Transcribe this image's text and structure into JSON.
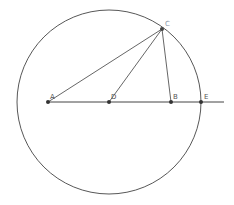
{
  "diagram": {
    "type": "geometry-construction",
    "circle": {
      "cx": 109,
      "cy": 102,
      "r": 92,
      "stroke": "#444444"
    },
    "baseline": {
      "x1": 48,
      "y1": 102,
      "x2": 224,
      "y2": 102
    },
    "points": {
      "A": {
        "label": "A",
        "x": 48,
        "y": 102,
        "lx": 50,
        "ly": 99
      },
      "D": {
        "label": "D",
        "x": 109,
        "y": 102,
        "lx": 111,
        "ly": 99
      },
      "B": {
        "label": "B",
        "x": 171,
        "y": 102,
        "lx": 173,
        "ly": 99
      },
      "E": {
        "label": "E",
        "x": 201,
        "y": 102,
        "lx": 204,
        "ly": 99
      },
      "C": {
        "label": "C",
        "x": 162,
        "y": 29,
        "lx": 165,
        "ly": 26
      }
    },
    "segments": [
      {
        "from": "A",
        "to": "C"
      },
      {
        "from": "D",
        "to": "C"
      },
      {
        "from": "B",
        "to": "C"
      }
    ],
    "colors": {
      "line": "#444444",
      "point": "#333333",
      "label": "#555555",
      "label_c": "#8a96a8"
    }
  }
}
